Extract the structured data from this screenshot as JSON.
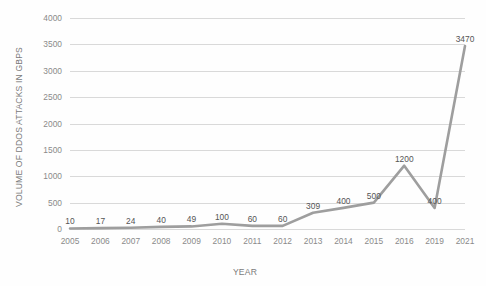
{
  "chart_data": {
    "type": "line",
    "title": "",
    "xlabel": "YEAR",
    "ylabel": "VOLUME OF DDOS ATTACKS IN GBPS",
    "categories": [
      "2005",
      "2006",
      "2007",
      "2008",
      "2009",
      "2010",
      "2011",
      "2012",
      "2013",
      "2014",
      "2015",
      "2016",
      "2019",
      "2021"
    ],
    "values": [
      10,
      17,
      24,
      40,
      49,
      100,
      60,
      60,
      309,
      400,
      500,
      1200,
      400,
      3470
    ],
    "data_labels": [
      "10",
      "17",
      "24",
      "40",
      "49",
      "100",
      "60",
      "60",
      "309",
      "400",
      "500",
      "1200",
      "400",
      "3470"
    ],
    "ylim": [
      0,
      4000
    ],
    "yticks": [
      0,
      500,
      1000,
      1500,
      2000,
      2500,
      3000,
      3500,
      4000
    ],
    "ytick_labels": [
      "0",
      "500",
      "1000",
      "1500",
      "2000",
      "2500",
      "3000",
      "3500",
      "4000"
    ],
    "grid": true,
    "legend": false,
    "legend_position": "none",
    "series": [
      {
        "name": "Volume of DDoS attacks",
        "values": [
          10,
          17,
          24,
          40,
          49,
          100,
          60,
          60,
          309,
          400,
          500,
          1200,
          400,
          3470
        ]
      }
    ],
    "colors": {
      "line": "#9e9e9e",
      "gridline": "#d9d9d9",
      "tick_text": "#8a8a8a",
      "axis_title_text": "#7a7a7a",
      "data_label_text": "#555555",
      "background": "#fefefe"
    }
  }
}
